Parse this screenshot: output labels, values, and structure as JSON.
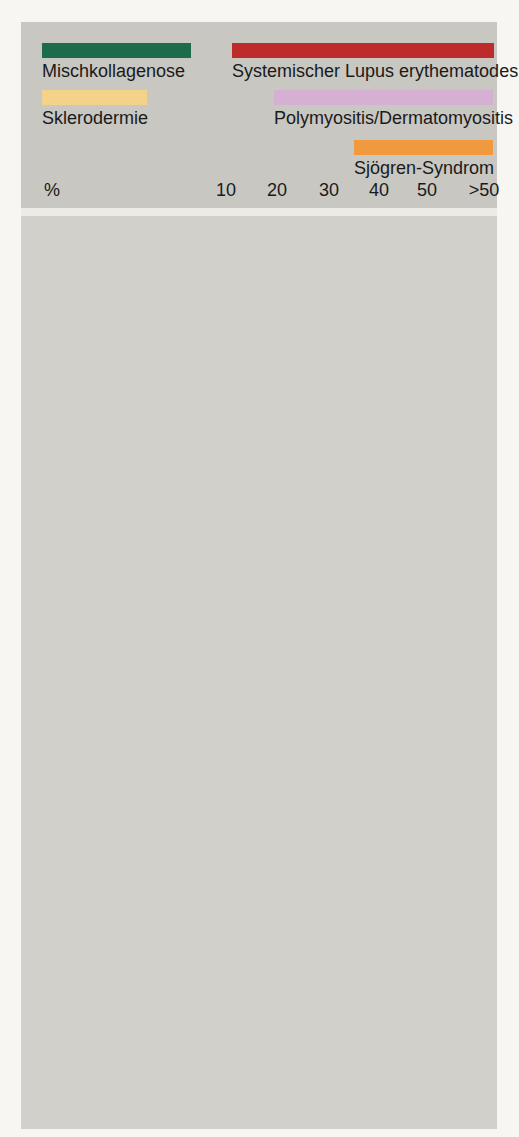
{
  "chart_data": {
    "type": "bar",
    "title": "",
    "unit": "%",
    "axis": {
      "label": "%",
      "ticks": [
        {
          "label": "10",
          "frac": 0.049
        },
        {
          "label": "20",
          "frac": 0.229
        },
        {
          "label": "30",
          "frac": 0.412
        },
        {
          "label": "40",
          "frac": 0.588
        },
        {
          "label": "50",
          "frac": 0.757
        },
        {
          "label": ">50",
          "frac": 0.958
        }
      ],
      "range": [
        0,
        55
      ],
      "grid": false,
      "legend_position": "top"
    },
    "series": [
      {
        "key": "mischkollagenose",
        "label": "Mischkollagenose",
        "color": "#1e6b4b",
        "thick": true
      },
      {
        "key": "sle",
        "label": "Systemischer Lupus erythematodes",
        "color": "#bd2b2a",
        "thick": true
      },
      {
        "key": "sklerodermie",
        "label": "Sklerodermie",
        "color": "#f4d289",
        "pale_color": "#f8e2ae"
      },
      {
        "key": "polymyositis",
        "label": "Polymyositis/Dermatomyositis",
        "color": "#d6b0d2",
        "pale_color": "#dcc6d9"
      },
      {
        "key": "sjoegren",
        "label": "Sjögren-Syndrom",
        "color": "#f1993f"
      }
    ],
    "rows": [
      {
        "organ": "Lymphknoten",
        "icon": "lymph-node",
        "bars": [
          {
            "series": "mischkollagenose",
            "value": "40",
            "end": 0.595
          },
          {
            "series": "sle",
            "value": ">50",
            "end": 1.0
          },
          {
            "spacer": true
          },
          {
            "series": "sjoegren",
            "value": "20",
            "end": 0.229
          }
        ]
      },
      {
        "organ": "Lunge",
        "icon": "lung",
        "bars": [
          {
            "series": "mischkollagenose",
            "value": ">50",
            "end": 1.0
          },
          {
            "series": "sle",
            "value": "10–20",
            "end": 0.2,
            "fade_from": 0.106
          },
          {
            "series": "sklerodermie",
            "value": ">50",
            "end": 1.0,
            "pale": true
          },
          {
            "series": "polymyositis",
            "value": "20",
            "end": 0.229,
            "pale": true
          },
          {
            "series": "sjoegren",
            "value": "20",
            "end": 0.229
          }
        ]
      },
      {
        "organ": "Gelenke",
        "icon": "joint",
        "bars": [
          {
            "series": "mischkollagenose",
            "value": ">50",
            "end": 1.0
          },
          {
            "series": "sle",
            "value": ">50",
            "end": 1.0
          },
          {
            "series": "sklerodermie",
            "value": "45",
            "end": 0.711,
            "pale": true
          },
          {
            "series": "polymyositis",
            "value": "20",
            "end": 0.26,
            "pale": true,
            "fade_from": 0.14
          },
          {
            "series": "sjoegren",
            "value": ">50",
            "end": 1.0
          }
        ]
      },
      {
        "organ": "Niere",
        "icon": "kidney",
        "bars": [
          {
            "series": "mischkollagenose",
            "value": "30",
            "end": 0.412
          },
          {
            "series": "sle",
            "value": "30–35",
            "end": 0.542,
            "fade_from": 0.412
          },
          {
            "series": "sklerodermie",
            "value": "20",
            "end": 0.218,
            "pale": true
          },
          {
            "spacer": true
          },
          {
            "series": "sjoegren",
            "value": "40",
            "end": 0.581
          }
        ]
      },
      {
        "organ": "Haut",
        "icon": "skin",
        "bars": [
          {
            "series": "mischkollagenose",
            "value": "35–45",
            "end": 0.704,
            "fade_from": 0.493
          },
          {
            "series": "sle",
            "value": ">50",
            "end": 1.0
          },
          {
            "series": "sklerodermie",
            "value": ">50",
            "end": 1.0
          },
          {
            "series": "polymyositis",
            "value": ">50",
            "end": 1.0
          }
        ]
      },
      {
        "organ": "Gefäße",
        "icon": "vessel",
        "bars": [
          {
            "series": "mischkollagenose",
            "value": ">50",
            "end": 1.0
          },
          {
            "series": "sle",
            "value": "20",
            "end": 0.225
          },
          {
            "series": "sklerodermie",
            "value": ">50",
            "end": 1.0,
            "pale": true
          },
          {
            "series": "polymyositis",
            "value": "20",
            "end": 0.26,
            "pale": true,
            "fade_from": 0.14
          }
        ]
      },
      {
        "organ": "Herz",
        "icon": "heart",
        "bars": [
          {
            "series": "mischkollagenose",
            "value": "35–45",
            "end": 0.704,
            "fade_from": 0.493
          },
          {
            "series": "sle",
            "value": "30–35",
            "end": 0.528,
            "fade_from": 0.377
          },
          {
            "series": "sklerodermie",
            "value": "15",
            "end": 0.141
          },
          {
            "series": "polymyositis",
            "value": "30",
            "end": 0.412,
            "pale": true
          }
        ]
      },
      {
        "organ": "Ösophagus/\nGastro-\nintestinal-\ntrakt",
        "icon": "gi-tract",
        "bars": [
          {
            "series": "mischkollagenose",
            "value": ">50",
            "end": 0.99
          },
          {
            "series": "sle",
            "value": "50",
            "end": 0.771
          },
          {
            "series": "sklerodermie",
            "value": "50",
            "end": 0.775,
            "pale": true
          },
          {
            "series": "polymyositis",
            "value": "20",
            "end": 0.211,
            "pale": true,
            "fade_from": 0.14
          }
        ]
      },
      {
        "organ": "Knochen",
        "icon": "bone",
        "bars": [
          {
            "series": "sklerodermie",
            "value": ">50",
            "end": 1.0
          }
        ]
      },
      {
        "organ": "Muskeln",
        "icon": "muscle",
        "bars": [
          {
            "series": "mischkollagenose",
            "value": ">50",
            "end": 1.0
          },
          {
            "series": "sle",
            "value": "35–45",
            "end": 0.7,
            "fade_from": 0.493
          },
          {
            "series": "sklerodermie",
            "value": ">50",
            "end": 1.0
          },
          {
            "series": "polymyositis",
            "value": ">50",
            "end": 1.0
          }
        ]
      }
    ]
  }
}
